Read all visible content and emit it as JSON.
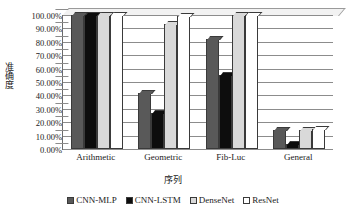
{
  "chart_data": {
    "type": "bar",
    "title": "",
    "xlabel": "序列",
    "ylabel": "准确度",
    "categories": [
      "Arithmetic",
      "Geometric",
      "Fib-Luc",
      "General"
    ],
    "series": [
      {
        "name": "CNN-MLP",
        "color": "#595959",
        "values": [
          100.0,
          42.0,
          82.0,
          14.0
        ]
      },
      {
        "name": "CNN-LSTM",
        "color": "#0d0d0d",
        "values": [
          100.0,
          27.0,
          55.0,
          4.0
        ]
      },
      {
        "name": "DenseNet",
        "color": "#d9d9d9",
        "values": [
          100.0,
          93.0,
          100.0,
          14.0
        ]
      },
      {
        "name": "ResNet",
        "color": "#ffffff",
        "values": [
          100.0,
          99.0,
          100.0,
          15.0
        ]
      }
    ],
    "ylim": [
      0,
      100
    ],
    "ytick_labels": [
      "100.00%",
      "90.00%",
      "80.00%",
      "70.00%",
      "60.00%",
      "50.00%",
      "40.00%",
      "30.00%",
      "20.00%",
      "10.00%",
      "0.00%"
    ],
    "ytick_values": [
      100,
      90,
      80,
      70,
      60,
      50,
      40,
      30,
      20,
      10,
      0
    ],
    "grid": true,
    "legend_position": "bottom"
  }
}
